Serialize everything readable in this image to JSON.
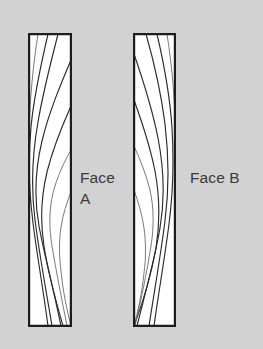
{
  "figure": {
    "kind": "wood-board-grain-diagram",
    "background_color": "#d2d2d2",
    "board_fill_color": "#ffffff",
    "board_outline_color": "#1d1d1d",
    "grain_color": "#2b2b2b",
    "grain_faint_color": "#6b6b6b",
    "label_color": "#3a3a3a"
  },
  "labels": {
    "face_a_line1": "Face",
    "face_a_line2": "A",
    "face_b": "Face B"
  },
  "boards": [
    {
      "id": "board-face-a",
      "name": "Face A",
      "x": 28,
      "y": 33,
      "width": 44,
      "height": 294,
      "grain_bulge_direction": "left",
      "grain_line_count": 7
    },
    {
      "id": "board-face-b",
      "name": "Face B",
      "x": 133,
      "y": 33,
      "width": 43,
      "height": 294,
      "grain_bulge_direction": "right",
      "grain_line_count": 7
    }
  ],
  "geometry": {
    "board_a_rect": "M29.1,34.1 L70.9,34.1 L70.9,325.9 L29.1,325.9 Z",
    "board_b_rect": "M134.1,34.1 L174.9,34.1 L174.9,325.9 L134.1,325.9 Z",
    "board_a_clip": "M29,34 L71,34 L71,326 L29,326 Z",
    "board_b_clip": "M134,34 L175,34 L175,326 L134,326 Z",
    "grain_a": [
      "M71,60 C60,86 49,112 42,141 C35,170 34,198 39,226 C44,254 52,282 61,326",
      "M71,106 C62,126 53,148 47,172 C41,197 40,221 44,246 C48,272 55,298 63,326",
      "M71,150 C64,162 57,177 53,193 C49,210 49,228 52,246 C56,271 62,300 67,326",
      "M58,34 C51,62 43,92 38,122 C32,156 31,189 35,220 C39,252 45,284 52,326",
      "M48,34 C41,64 34,95 31,127 C28,160 29,192 33,223 C37,255 43,288 48,326",
      "M71,192 C67,202 63,214 61,227 C59,241 59,256 61,271 C63,292 67,310 71,326",
      "M38,34 C33,66 30,98 29,130"
    ],
    "grain_b": [
      "M134,54 C143,80 152,108 158,138 C164,169 165,199 160,228 C155,258 146,290 137,326",
      "M134,100 C142,122 150,146 155,171 C160,198 160,223 156,248 C151,276 143,302 134,326",
      "M134,146 C140,159 146,174 150,190 C154,208 154,227 151,246 C147,272 141,300 135,326",
      "M146,34 C154,62 161,92 165,124 C169,157 169,190 165,221 C161,253 155,287 149,326",
      "M157,34 C164,64 170,96 172,128 C174,161 173,193 169,224 C165,256 159,290 154,326",
      "M134,190 C138,201 142,214 144,228 C146,243 146,258 144,273 C142,293 138,311 134,326",
      "M167,34 C172,66 175,98 175,130"
    ]
  },
  "label_positions": {
    "face_a_x": 80,
    "face_a_y1": 183,
    "face_a_y2": 204,
    "face_b_x": 190,
    "face_b_y": 183
  }
}
